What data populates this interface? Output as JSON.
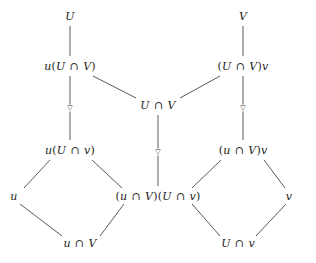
{
  "diagram": {
    "type": "hasse-lattice-diagram",
    "background_color": "#ffffff",
    "text_color": "#242424",
    "edge_color": "#5a5a5a",
    "nodes": [
      {
        "id": "U",
        "label": "U",
        "x": 70,
        "y": 16
      },
      {
        "id": "V",
        "label": "V",
        "x": 243,
        "y": 16
      },
      {
        "id": "uUV",
        "label": "u(U ∩ V)",
        "x": 70,
        "y": 66
      },
      {
        "id": "UVv",
        "label": "(U ∩ V)v",
        "x": 243,
        "y": 66
      },
      {
        "id": "UV",
        "label": "U ∩ V",
        "x": 158,
        "y": 105
      },
      {
        "id": "uUv",
        "label": "u(U ∩ v)",
        "x": 70,
        "y": 150
      },
      {
        "id": "uVv",
        "label": "(u ∩ V)v",
        "x": 243,
        "y": 150
      },
      {
        "id": "u",
        "label": "u",
        "x": 14,
        "y": 196
      },
      {
        "id": "center",
        "label": "(u ∩ V)(U ∩ v)",
        "x": 158,
        "y": 196
      },
      {
        "id": "v",
        "label": "v",
        "x": 289,
        "y": 196
      },
      {
        "id": "uIV",
        "label": "u ∩ V",
        "x": 80,
        "y": 243
      },
      {
        "id": "UIv",
        "label": "U ∩ v",
        "x": 238,
        "y": 243
      }
    ],
    "edges": [
      {
        "from": "U",
        "to": "uUV",
        "x1": 70,
        "y1": 26,
        "x2": 70,
        "y2": 56
      },
      {
        "from": "V",
        "to": "UVv",
        "x1": 243,
        "y1": 26,
        "x2": 243,
        "y2": 56
      },
      {
        "from": "uUV",
        "to": "uUv",
        "x1": 70,
        "y1": 76,
        "x2": 70,
        "y2": 140,
        "marker": "nabla",
        "marker_x": 70,
        "marker_y": 108
      },
      {
        "from": "UVv",
        "to": "uVv",
        "x1": 243,
        "y1": 76,
        "x2": 243,
        "y2": 140,
        "marker": "nabla",
        "marker_x": 243,
        "marker_y": 108
      },
      {
        "from": "uUV",
        "to": "UV",
        "x1": 93,
        "y1": 76,
        "x2": 136,
        "y2": 98
      },
      {
        "from": "UVv",
        "to": "UV",
        "x1": 220,
        "y1": 76,
        "x2": 180,
        "y2": 98
      },
      {
        "from": "UV",
        "to": "center",
        "x1": 158,
        "y1": 115,
        "x2": 158,
        "y2": 186,
        "marker": "nabla",
        "marker_x": 158,
        "marker_y": 152
      },
      {
        "from": "uUv",
        "to": "u",
        "x1": 50,
        "y1": 160,
        "x2": 24,
        "y2": 188
      },
      {
        "from": "uUv",
        "to": "center",
        "x1": 92,
        "y1": 160,
        "x2": 122,
        "y2": 188
      },
      {
        "from": "uVv",
        "to": "center",
        "x1": 221,
        "y1": 160,
        "x2": 192,
        "y2": 188
      },
      {
        "from": "uVv",
        "to": "v",
        "x1": 264,
        "y1": 160,
        "x2": 285,
        "y2": 188
      },
      {
        "from": "u",
        "to": "uIV",
        "x1": 20,
        "y1": 204,
        "x2": 62,
        "y2": 236
      },
      {
        "from": "center",
        "to": "uIV",
        "x1": 124,
        "y1": 204,
        "x2": 100,
        "y2": 236
      },
      {
        "from": "center",
        "to": "UIv",
        "x1": 192,
        "y1": 204,
        "x2": 220,
        "y2": 236
      },
      {
        "from": "v",
        "to": "UIv",
        "x1": 286,
        "y1": 204,
        "x2": 256,
        "y2": 236
      }
    ],
    "markers": [
      {
        "id": "marker-left",
        "glyph": "▽",
        "x": 70,
        "y": 108
      },
      {
        "id": "marker-center",
        "glyph": "▽",
        "x": 158,
        "y": 152
      },
      {
        "id": "marker-right",
        "glyph": "▽",
        "x": 243,
        "y": 108
      }
    ]
  }
}
